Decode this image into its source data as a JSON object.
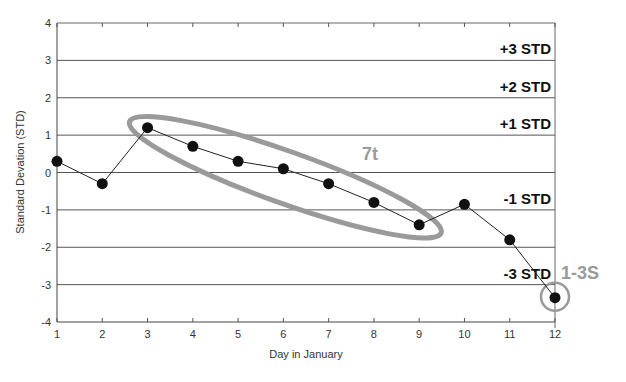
{
  "chart_data": {
    "type": "line",
    "title": "",
    "xlabel": "Day in January",
    "ylabel": "Standard Devation (STD)",
    "x": [
      1,
      2,
      3,
      4,
      5,
      6,
      7,
      8,
      9,
      10,
      11,
      12
    ],
    "series": [
      {
        "name": "Control values",
        "values": [
          0.3,
          -0.3,
          1.2,
          0.7,
          0.3,
          0.1,
          -0.3,
          -0.8,
          -1.4,
          -0.85,
          -1.8,
          -3.35
        ]
      }
    ],
    "xlim": [
      1,
      12
    ],
    "ylim": [
      -4,
      4
    ],
    "xticks": [
      "1",
      "2",
      "3",
      "4",
      "5",
      "6",
      "7",
      "8",
      "9",
      "10",
      "11",
      "12"
    ],
    "yticks": [
      "4",
      "3",
      "2",
      "1",
      "0",
      "-1",
      "-2",
      "-3",
      "-4"
    ],
    "grid": "horizontal",
    "reference_lines": [
      {
        "value": 3,
        "label": "+3 STD"
      },
      {
        "value": 2,
        "label": "+2 STD"
      },
      {
        "value": 1,
        "label": "+1 STD"
      },
      {
        "value": 0,
        "label": ""
      },
      {
        "value": -1,
        "label": "-1 STD"
      },
      {
        "value": -2,
        "label": ""
      },
      {
        "value": -3,
        "label": "-3 STD"
      }
    ],
    "annotations": [
      {
        "label": "7t",
        "type": "ellipse",
        "covers_days": [
          3,
          9
        ]
      },
      {
        "label": "1-3S",
        "type": "circle",
        "covers_days": [
          12
        ]
      }
    ]
  },
  "colors": {
    "gridline": "#555555",
    "points": "#111111",
    "annotation": "#9a9a9a"
  }
}
